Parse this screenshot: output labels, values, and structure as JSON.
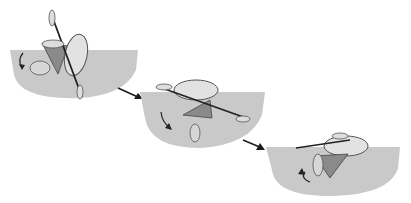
{
  "figure": {
    "stages": [
      {
        "id": 1,
        "name": "capsized-setup"
      },
      {
        "id": 2,
        "name": "sweep"
      },
      {
        "id": 3,
        "name": "recovery"
      }
    ],
    "colors": {
      "water": "#c8c8c8",
      "water_edge": "#a9a9a9",
      "hull": "#d4d4d4",
      "body": "#8a8a8a",
      "line": "#2a2a2a",
      "arrow": "#1a1a1a"
    }
  }
}
